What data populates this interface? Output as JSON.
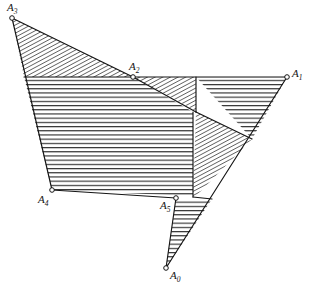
{
  "figure": {
    "background_color": "#ffffff",
    "stroke_color": "#141414",
    "hatch_color": "#1a1a1a",
    "width": 309,
    "height": 288,
    "vertices": [
      {
        "id": "A0",
        "letter": "A",
        "subscript": "0",
        "x": 166,
        "y": 268,
        "label_x": 170,
        "label_y": 270,
        "marker": "open-circle"
      },
      {
        "id": "A1",
        "letter": "A",
        "subscript": "1",
        "x": 287,
        "y": 77,
        "label_x": 292,
        "label_y": 68,
        "marker": "open-circle"
      },
      {
        "id": "A2",
        "letter": "A",
        "subscript": "2",
        "x": 133,
        "y": 77,
        "label_x": 129,
        "label_y": 61,
        "marker": "open-circle"
      },
      {
        "id": "A3",
        "letter": "A",
        "subscript": "3",
        "x": 12,
        "y": 18,
        "label_x": 7,
        "label_y": 2,
        "marker": "open-circle"
      },
      {
        "id": "A4",
        "letter": "A",
        "subscript": "4",
        "x": 52,
        "y": 190,
        "label_x": 38,
        "label_y": 194,
        "marker": "open-circle"
      },
      {
        "id": "A5",
        "letter": "A",
        "subscript": "5",
        "x": 176,
        "y": 198,
        "label_x": 160,
        "label_y": 200,
        "marker": "open-circle"
      }
    ],
    "regions": [
      {
        "name": "upper-left-triangle",
        "hatch": "diagonal",
        "points": "12,18 133,77 24,77"
      },
      {
        "name": "central-quadrilateral",
        "hatch": "horizontal",
        "points": "24,77 133,77 193,112 193,196 52,190"
      },
      {
        "name": "a2-wedge-triangle",
        "hatch": "diagonal",
        "points": "133,77 196,77 196,111"
      },
      {
        "name": "upper-right-triangle",
        "hatch": "horizontal",
        "points": "196,77 287,77 252,139"
      },
      {
        "name": "right-diagonal-band",
        "hatch": "diagonal",
        "points": "196,112 252,139 194,198 193,196"
      },
      {
        "name": "bottom-spike-triangle",
        "hatch": "horizontal",
        "points": "176,199 212,199 166,268"
      }
    ],
    "edges": [
      {
        "name": "edge-a3-a2",
        "x1": 12,
        "y1": 18,
        "x2": 133,
        "y2": 77
      },
      {
        "name": "edge-a3-a4",
        "x1": 12,
        "y1": 18,
        "x2": 52,
        "y2": 190
      },
      {
        "name": "edge-a4-a5",
        "x1": 52,
        "y1": 190,
        "x2": 176,
        "y2": 198
      },
      {
        "name": "edge-a5-a0",
        "x1": 176,
        "y1": 198,
        "x2": 166,
        "y2": 268
      },
      {
        "name": "edge-a0-a1",
        "x1": 166,
        "y1": 268,
        "x2": 287,
        "y2": 77
      },
      {
        "name": "edge-a1-a2",
        "x1": 287,
        "y1": 77,
        "x2": 133,
        "y2": 77
      },
      {
        "name": "edge-hatch-base-left",
        "x1": 24,
        "y1": 77,
        "x2": 133,
        "y2": 77
      },
      {
        "name": "edge-a2-inner-diagonal",
        "x1": 133,
        "y1": 77,
        "x2": 196,
        "y2": 112
      },
      {
        "name": "edge-inner-vertical",
        "x1": 196,
        "y1": 77,
        "x2": 196,
        "y2": 112
      },
      {
        "name": "edge-inner-diagonal-right",
        "x1": 196,
        "y1": 112,
        "x2": 252,
        "y2": 139
      },
      {
        "name": "edge-inner-right-column",
        "x1": 193,
        "y1": 112,
        "x2": 193,
        "y2": 197
      },
      {
        "name": "edge-a5-band",
        "x1": 193,
        "y1": 197,
        "x2": 212,
        "y2": 199
      }
    ]
  }
}
